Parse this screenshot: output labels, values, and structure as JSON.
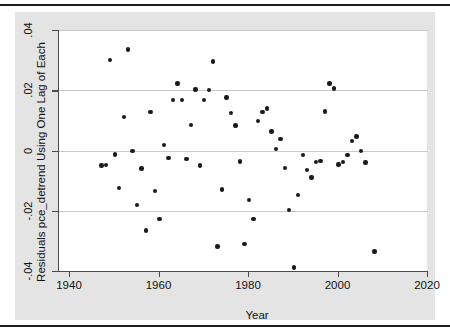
{
  "figure": {
    "background_color": "#e4e4e4",
    "plot_background_color": "#ffffff",
    "marker_color": "#1a1a1a",
    "grid_color": "#c9c9c9",
    "axis_color": "#4a4a4a",
    "rule_color": "#1c1c1c"
  },
  "chart_data": {
    "type": "scatter",
    "title": "",
    "xlabel": "Year",
    "ylabel": "Residuals pce_detrend Using One Lag of Each",
    "xlim": [
      1936,
      2022
    ],
    "ylim": [
      -0.04,
      0.04
    ],
    "xticks": [
      1940,
      1960,
      1980,
      2000,
      2020
    ],
    "xtick_labels": [
      "1940",
      "1960",
      "1980",
      "2000",
      "2020"
    ],
    "yticks": [
      0.04,
      0.02,
      0,
      -0.02,
      -0.04
    ],
    "ytick_labels": [
      ".04",
      ".02",
      "0",
      "-.02",
      "-.04"
    ],
    "grid": "horizontal",
    "legend": "none",
    "marker": "filled-circle",
    "n_points": 61,
    "x": [
      1947,
      1948,
      1949,
      1950,
      1951,
      1952,
      1953,
      1954,
      1955,
      1956,
      1957,
      1958,
      1959,
      1960,
      1961,
      1962,
      1963,
      1964,
      1965,
      1966,
      1967,
      1968,
      1969,
      1970,
      1971,
      1972,
      1973,
      1974,
      1975,
      1976,
      1977,
      1978,
      1979,
      1980,
      1981,
      1982,
      1983,
      1984,
      1985,
      1986,
      1987,
      1988,
      1989,
      1990,
      1991,
      1992,
      1993,
      1994,
      1995,
      1996,
      1997,
      1998,
      1999,
      2000,
      2001,
      2002,
      2003,
      2004,
      2005,
      2006,
      2008
    ],
    "y": [
      -0.005,
      -0.0048,
      0.03,
      -0.0013,
      -0.0125,
      0.0112,
      0.0335,
      -0.0001,
      -0.018,
      -0.006,
      -0.0265,
      0.0128,
      -0.0135,
      -0.0228,
      0.0018,
      -0.0024,
      0.0168,
      0.0222,
      0.0167,
      -0.0028,
      0.0084,
      0.0203,
      -0.005,
      0.0168,
      0.0201,
      0.0295,
      -0.0318,
      -0.013,
      0.0176,
      0.0124,
      0.0083,
      -0.0037,
      -0.031,
      -0.0165,
      -0.0228,
      0.0098,
      0.0127,
      0.014,
      0.0063,
      0.0004,
      0.0038,
      -0.0058,
      -0.0198,
      -0.0388,
      -0.0148,
      -0.0014,
      -0.0065,
      -0.0089,
      -0.0039,
      -0.0034,
      0.0129,
      0.0222,
      0.0206,
      -0.0047,
      -0.0039,
      -0.0014,
      0.0032,
      0.0047,
      -0.0002,
      -0.004,
      -0.0335
    ]
  }
}
